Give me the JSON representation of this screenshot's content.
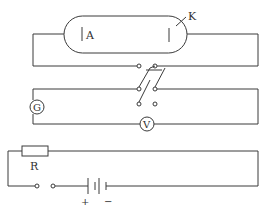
{
  "diagram": {
    "type": "circuit",
    "labels": {
      "anode": "A",
      "cathode": "K",
      "galvanometer": "G",
      "voltmeter": "V",
      "resistor": "R",
      "plus": "+",
      "minus": "−"
    },
    "components": [
      {
        "id": "phototube",
        "label": "photoelectric tube"
      },
      {
        "id": "anode",
        "label": "A"
      },
      {
        "id": "cathode",
        "label": "K"
      },
      {
        "id": "reversing-switch",
        "label": "double-pole double-throw switch"
      },
      {
        "id": "galvanometer",
        "label": "G"
      },
      {
        "id": "voltmeter",
        "label": "V"
      },
      {
        "id": "resistor",
        "label": "R"
      },
      {
        "id": "key-switch",
        "label": "switch"
      },
      {
        "id": "battery",
        "label": "battery",
        "polarity": [
          "+",
          "−"
        ]
      }
    ],
    "colors": {
      "line": "#3a3a3a",
      "background": "#ffffff"
    }
  }
}
